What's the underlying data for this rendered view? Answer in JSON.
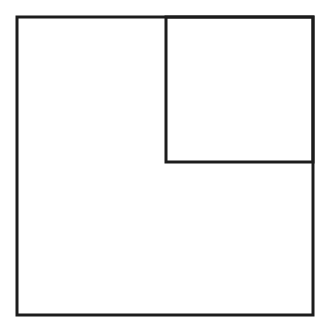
{
  "diagram": {
    "canvas": {
      "width": 330,
      "height": 333,
      "background": "#ffffff"
    },
    "stroke_color": "#1c1c1c",
    "stroke_width": 3,
    "shapes": [
      {
        "id": "outer-square",
        "x": 17,
        "y": 17,
        "width": 296,
        "height": 298
      },
      {
        "id": "inner-square",
        "x": 166,
        "y": 17,
        "width": 147,
        "height": 145
      }
    ]
  }
}
